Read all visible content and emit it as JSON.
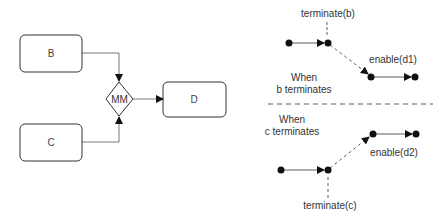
{
  "left_diagram": {
    "boxes": [
      {
        "id": "B",
        "label": "B"
      },
      {
        "id": "C",
        "label": "C"
      },
      {
        "id": "D",
        "label": "D"
      }
    ],
    "gateway": {
      "label": "MM"
    }
  },
  "right_diagram": {
    "top_scenario": {
      "caption_line1": "When",
      "caption_line2": "b terminates",
      "event_label": "terminate(b)",
      "enable_label": "enable(d1)"
    },
    "bottom_scenario": {
      "caption_line1": "When",
      "caption_line2": "c terminates",
      "event_label": "terminate(c)",
      "enable_label": "enable(d2)"
    }
  },
  "colors": {
    "stroke": "#333333",
    "connector": "#555555",
    "dot": "#111111"
  }
}
